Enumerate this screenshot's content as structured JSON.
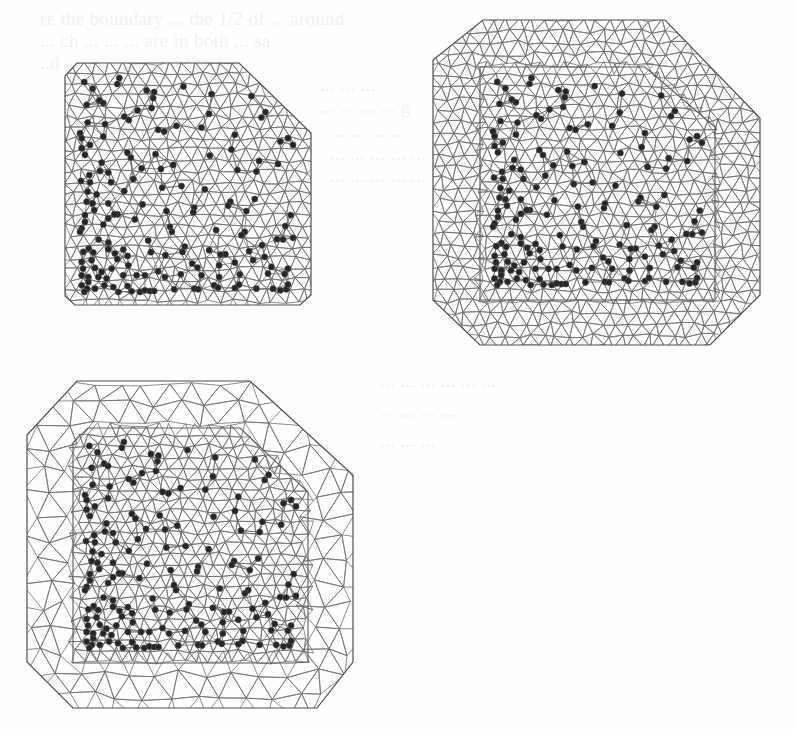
{
  "page": {
    "background": "#fefefe",
    "mesh_color": "#707070",
    "outline_color": "#4e4e4e",
    "site_color": "#262626",
    "bleed_through_text": [
      {
        "x": 40,
        "y": 8,
        "text": "re the boundary ... the 1/2 of ... around"
      },
      {
        "x": 40,
        "y": 30,
        "text": "... ch ... ... ... are in both ... sa"
      },
      {
        "x": 40,
        "y": 52,
        "text": "..d ... ... ... ... ... ... the"
      },
      {
        "x": 320,
        "y": 74,
        "text": "... ... ..."
      },
      {
        "x": 320,
        "y": 96,
        "text": "... ... ... ... g"
      },
      {
        "x": 330,
        "y": 120,
        "text": "... ... ... ..."
      },
      {
        "x": 330,
        "y": 143,
        "text": "... ... ... ... ... th"
      },
      {
        "x": 330,
        "y": 165,
        "text": "... ... ... ... ..."
      },
      {
        "x": 380,
        "y": 370,
        "text": "... ... ... ... ... ..."
      },
      {
        "x": 380,
        "y": 400,
        "text": "... ... ... ..."
      },
      {
        "x": 380,
        "y": 430,
        "text": "... ... ..."
      }
    ]
  },
  "figures": [
    {
      "id": "mesh-a",
      "label": "Triangulated mesh restricted to data hull",
      "spacing": 12.5,
      "outer_spacing": 12.5,
      "seed": 11,
      "outer": [
        [
          77,
          63
        ],
        [
          239,
          63
        ],
        [
          311,
          133
        ],
        [
          311,
          295
        ],
        [
          300,
          305
        ],
        [
          75,
          305
        ],
        [
          65,
          296
        ],
        [
          65,
          76
        ]
      ],
      "inner": null,
      "dot_box": [
        80,
        78,
        293,
        292
      ]
    },
    {
      "id": "mesh-b",
      "label": "Triangulated mesh with extended fine buffer",
      "spacing": 12.5,
      "outer_spacing": 13,
      "seed": 23,
      "outer": [
        [
          483,
          20
        ],
        [
          665,
          20
        ],
        [
          760,
          118
        ],
        [
          760,
          295
        ],
        [
          710,
          345
        ],
        [
          480,
          345
        ],
        [
          433,
          300
        ],
        [
          433,
          60
        ]
      ],
      "inner": [
        [
          480,
          67
        ],
        [
          645,
          67
        ],
        [
          715,
          127
        ],
        [
          715,
          300
        ],
        [
          480,
          300
        ]
      ],
      "dot_box": [
        493,
        78,
        702,
        285
      ]
    },
    {
      "id": "mesh-c",
      "label": "Triangulated mesh with extended coarse buffer",
      "spacing": 12.5,
      "outer_spacing": 26,
      "seed": 37,
      "outer": [
        [
          77,
          381
        ],
        [
          250,
          381
        ],
        [
          353,
          475
        ],
        [
          353,
          662
        ],
        [
          317,
          708
        ],
        [
          73,
          708
        ],
        [
          27,
          662
        ],
        [
          27,
          435
        ]
      ],
      "inner": [
        [
          88,
          428
        ],
        [
          240,
          428
        ],
        [
          308,
          492
        ],
        [
          308,
          662
        ],
        [
          293,
          663
        ],
        [
          73,
          663
        ],
        [
          73,
          443
        ]
      ],
      "dot_box": [
        85,
        442,
        296,
        648
      ]
    }
  ],
  "sites": {
    "space": [
      75,
      70,
      715,
      710
    ],
    "radius": 3.1,
    "points": [
      [
        88,
        82
      ],
      [
        193,
        70
      ],
      [
        187,
        88
      ],
      [
        113,
        102
      ],
      [
        275,
        107
      ],
      [
        298,
        112
      ],
      [
        295,
        130
      ],
      [
        386,
        95
      ],
      [
        470,
        118
      ],
      [
        590,
        124
      ],
      [
        133,
        137
      ],
      [
        145,
        145
      ],
      [
        95,
        150
      ],
      [
        290,
        160
      ],
      [
        248,
        167
      ],
      [
        208,
        185
      ],
      [
        222,
        196
      ],
      [
        463,
        177
      ],
      [
        620,
        188
      ],
      [
        632,
        172
      ],
      [
        98,
        203
      ],
      [
        150,
        208
      ],
      [
        365,
        213
      ],
      [
        310,
        225
      ],
      [
        328,
        230
      ],
      [
        440,
        218
      ],
      [
        540,
        240
      ],
      [
        75,
        235
      ],
      [
        80,
        250
      ],
      [
        105,
        270
      ],
      [
        145,
        245
      ],
      [
        700,
        250
      ],
      [
        677,
        260
      ],
      [
        715,
        270
      ],
      [
        530,
        284
      ],
      [
        80,
        280
      ],
      [
        90,
        300
      ],
      [
        217,
        293
      ],
      [
        228,
        308
      ],
      [
        302,
        298
      ],
      [
        465,
        302
      ],
      [
        613,
        318
      ],
      [
        140,
        323
      ],
      [
        670,
        327
      ],
      [
        103,
        360
      ],
      [
        135,
        348
      ],
      [
        160,
        353
      ],
      [
        355,
        330
      ],
      [
        260,
        340
      ],
      [
        318,
        342
      ],
      [
        78,
        378
      ],
      [
        105,
        382
      ],
      [
        168,
        382
      ],
      [
        235,
        372
      ],
      [
        380,
        393
      ],
      [
        548,
        345
      ],
      [
        605,
        350
      ],
      [
        98,
        410
      ],
      [
        125,
        418
      ],
      [
        208,
        408
      ],
      [
        322,
        398
      ],
      [
        450,
        403
      ],
      [
        95,
        440
      ],
      [
        113,
        445
      ],
      [
        160,
        445
      ],
      [
        263,
        448
      ],
      [
        527,
        440
      ],
      [
        520,
        452
      ],
      [
        600,
        432
      ],
      [
        575,
        468
      ],
      [
        708,
        480
      ],
      [
        118,
        465
      ],
      [
        90,
        480
      ],
      [
        188,
        478
      ],
      [
        240,
        493
      ],
      [
        335,
        468
      ],
      [
        418,
        458
      ],
      [
        415,
        472
      ],
      [
        160,
        490
      ],
      [
        178,
        478
      ],
      [
        90,
        500
      ],
      [
        80,
        520
      ],
      [
        75,
        530
      ],
      [
        145,
        508
      ],
      [
        345,
        515
      ],
      [
        351,
        530
      ],
      [
        484,
        525
      ],
      [
        570,
        530
      ],
      [
        560,
        540
      ],
      [
        692,
        513
      ],
      [
        131,
        553
      ],
      [
        160,
        562
      ],
      [
        280,
        556
      ],
      [
        390,
        574
      ],
      [
        383,
        590
      ],
      [
        463,
        585
      ],
      [
        512,
        597
      ],
      [
        497,
        598
      ],
      [
        583,
        588
      ],
      [
        667,
        552
      ],
      [
        685,
        553
      ],
      [
        715,
        548
      ],
      [
        622,
        570
      ],
      [
        630,
        605
      ],
      [
        101,
        580
      ],
      [
        85,
        590
      ],
      [
        115,
        592
      ],
      [
        160,
        582
      ],
      [
        180,
        595
      ],
      [
        205,
        583
      ],
      [
        218,
        602
      ],
      [
        288,
        591
      ],
      [
        332,
        600
      ],
      [
        412,
        625
      ],
      [
        428,
        637
      ],
      [
        493,
        630
      ],
      [
        540,
        622
      ],
      [
        595,
        615
      ],
      [
        650,
        635
      ],
      [
        80,
        620
      ],
      [
        84,
        640
      ],
      [
        110,
        615
      ],
      [
        120,
        638
      ],
      [
        140,
        650
      ],
      [
        187,
        612
      ],
      [
        220,
        630
      ],
      [
        170,
        640
      ],
      [
        80,
        660
      ],
      [
        100,
        665
      ],
      [
        130,
        665
      ],
      [
        155,
        670
      ],
      [
        205,
        660
      ],
      [
        245,
        660
      ],
      [
        270,
        660
      ],
      [
        310,
        648
      ],
      [
        330,
        665
      ],
      [
        378,
        657
      ],
      [
        440,
        660
      ],
      [
        493,
        665
      ],
      [
        555,
        657
      ],
      [
        640,
        655
      ],
      [
        690,
        656
      ],
      [
        700,
        640
      ],
      [
        80,
        690
      ],
      [
        96,
        700
      ],
      [
        120,
        700
      ],
      [
        148,
        690
      ],
      [
        175,
        695
      ],
      [
        190,
        710
      ],
      [
        218,
        692
      ],
      [
        230,
        708
      ],
      [
        255,
        710
      ],
      [
        270,
        705
      ],
      [
        285,
        707
      ],
      [
        298,
        707
      ],
      [
        358,
        702
      ],
      [
        418,
        700
      ],
      [
        430,
        702
      ],
      [
        478,
        690
      ],
      [
        490,
        697
      ],
      [
        540,
        698
      ],
      [
        553,
        688
      ],
      [
        605,
        700
      ],
      [
        655,
        700
      ],
      [
        677,
        705
      ],
      [
        695,
        702
      ],
      [
        700,
        688
      ],
      [
        100,
        680
      ],
      [
        88,
        710
      ]
    ]
  }
}
